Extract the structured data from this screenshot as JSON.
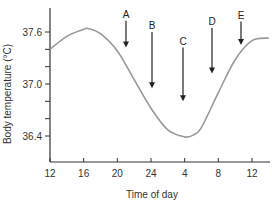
{
  "chart_data": {
    "type": "line",
    "title": "",
    "xlabel": "Time of day",
    "ylabel": "Body temperature (°C)",
    "x_ticks": [
      "12",
      "16",
      "20",
      "24",
      "4",
      "8",
      "12"
    ],
    "y_ticks": [
      "37.6",
      "37.0",
      "36.4"
    ],
    "y_minor_ticks": [
      37.6,
      37.4,
      37.2,
      37.0,
      36.8,
      36.6,
      36.4
    ],
    "ylim": [
      36.2,
      37.8
    ],
    "xlim_hours_elapsed": [
      0,
      26
    ],
    "grid": false,
    "legend": null,
    "series": [
      {
        "name": "Body temperature",
        "color": "#999999",
        "x_hours_elapsed": [
          0,
          2,
          4,
          4.5,
          6,
          8,
          10,
          12,
          14,
          16,
          17,
          18,
          20,
          22,
          24,
          26
        ],
        "x_time_of_day": [
          "12",
          "14",
          "16",
          "16:30",
          "18",
          "20",
          "22",
          "24",
          "2",
          "4",
          "5",
          "6",
          "8",
          "10",
          "12",
          "14"
        ],
        "values": [
          37.4,
          37.55,
          37.63,
          37.64,
          37.58,
          37.38,
          37.05,
          36.72,
          36.47,
          36.39,
          36.41,
          36.5,
          36.9,
          37.28,
          37.5,
          37.53
        ]
      }
    ],
    "annotations": [
      {
        "label": "A",
        "x_time": "21",
        "arrow_from": 37.73,
        "arrow_to": 37.42
      },
      {
        "label": "B",
        "x_time": "24",
        "arrow_from": 37.6,
        "arrow_to": 36.95
      },
      {
        "label": "C",
        "x_time": "4",
        "arrow_from": 37.42,
        "arrow_to": 36.8
      },
      {
        "label": "D",
        "x_time": "7",
        "arrow_from": 37.65,
        "arrow_to": 37.12
      },
      {
        "label": "E",
        "x_time": "11",
        "arrow_from": 37.72,
        "arrow_to": 37.45
      }
    ]
  },
  "axes": {
    "x_label": "Time of day",
    "y_label": "Body temperature (°C)"
  }
}
